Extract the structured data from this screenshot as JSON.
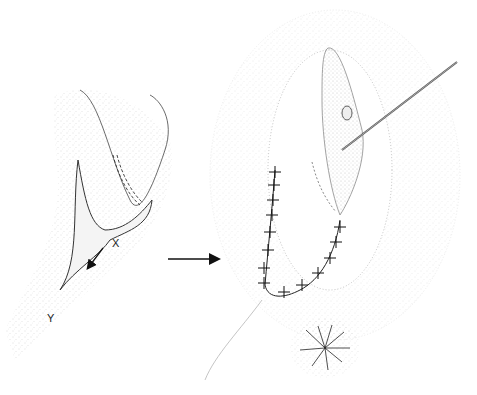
{
  "figure": {
    "labels": {
      "point_x": "X",
      "point_y": "Y"
    },
    "colors": {
      "ink": "#222222",
      "stipple": "#9a9a9a",
      "background": "#ffffff"
    }
  }
}
